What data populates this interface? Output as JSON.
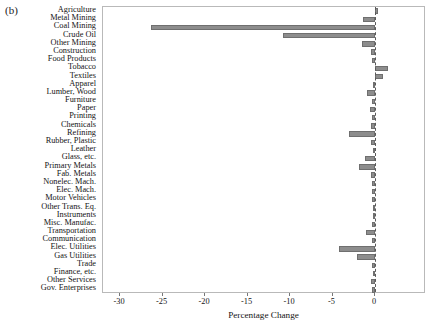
{
  "panel": {
    "label": "(b)"
  },
  "chart_data": {
    "type": "bar",
    "orientation": "horizontal",
    "title": "",
    "subtitle": "",
    "xlabel": "Percentage Change",
    "ylabel": "",
    "xlim": [
      -32,
      6
    ],
    "xticks": [
      -30,
      -25,
      -20,
      -15,
      -10,
      -5,
      0
    ],
    "xticklabels": [
      "-30",
      "-25",
      "-20",
      "-15",
      "-10",
      "-5",
      "0"
    ],
    "grid": false,
    "legend": null,
    "bar_color": "#8d8d8d",
    "zero_line": 0,
    "categories": [
      "Agriculture",
      "Metal Mining",
      "Coal Mining",
      "Crude Oil",
      "Other Mining",
      "Construction",
      "Food Products",
      "Tobacco",
      "Textiles",
      "Apparel",
      "Lumber, Wood",
      "Furniture",
      "Paper",
      "Printing",
      "Chemicals",
      "Refining",
      "Rubber, Plastic",
      "Leather",
      "Glass, etc.",
      "Primary Metals",
      "Fab. Metals",
      "Nonelec. Mach.",
      "Elec. Mach.",
      "Motor Vehicles",
      "Other Trans. Eq.",
      "Instruments",
      "Misc. Manufac.",
      "Transportation",
      "Communication",
      "Elec. Utilities",
      "Gas Utilities",
      "Trade",
      "Finance, etc.",
      "Other Services",
      "Gov. Enterprises"
    ],
    "values": [
      0.4,
      -1.4,
      -26.3,
      -10.8,
      -1.5,
      -0.5,
      -0.3,
      1.5,
      0.9,
      -0.2,
      -0.9,
      -0.4,
      -0.6,
      -0.3,
      -0.5,
      -3.1,
      -0.5,
      -0.2,
      -1.2,
      -1.9,
      -0.5,
      -0.3,
      -0.4,
      -0.3,
      -0.2,
      -0.2,
      -0.3,
      -1.1,
      -0.3,
      -4.2,
      -2.1,
      -0.3,
      -0.2,
      -0.5,
      -0.3
    ]
  }
}
